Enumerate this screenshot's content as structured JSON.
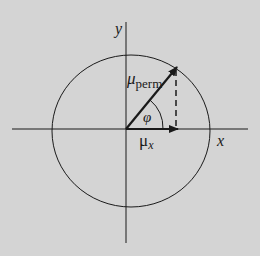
{
  "diagram": {
    "axes": {
      "x_label": "x",
      "y_label": "y"
    },
    "vectors": {
      "perm_symbol": "μ",
      "perm_subscript": "perm",
      "x_symbol": "μ",
      "x_subscript": "x"
    },
    "angle_label": "φ",
    "colors": {
      "background": "#d4d4d4",
      "ink": "#1a1a1a"
    }
  }
}
